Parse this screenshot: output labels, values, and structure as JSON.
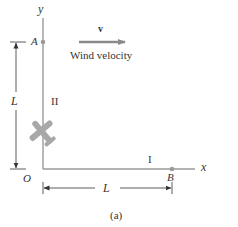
{
  "figure": {
    "caption": "(a)",
    "axes": {
      "x_label": "x",
      "y_label": "y",
      "origin_label": "O"
    },
    "points": [
      {
        "id": "A",
        "label": "A",
        "axis": "y",
        "position": "L"
      },
      {
        "id": "B",
        "label": "B",
        "axis": "x",
        "position": "L"
      }
    ],
    "legs": [
      {
        "id": "I",
        "label": "I",
        "along": "x-axis"
      },
      {
        "id": "II",
        "label": "II",
        "along": "y-axis"
      }
    ],
    "dimensions": {
      "vertical_label": "L",
      "horizontal_label": "L"
    },
    "wind": {
      "vector_label": "v",
      "caption": "Wind velocity",
      "direction": "positive-x"
    },
    "airplane": {
      "icon": "airplane-icon",
      "location": "on y-axis between O and A"
    },
    "colors": {
      "axis": "#9a9a9a",
      "vector": "#8a8a8a",
      "airplane": "#a8a8a8",
      "text": "#333333",
      "point": "#9a9a9a"
    }
  }
}
